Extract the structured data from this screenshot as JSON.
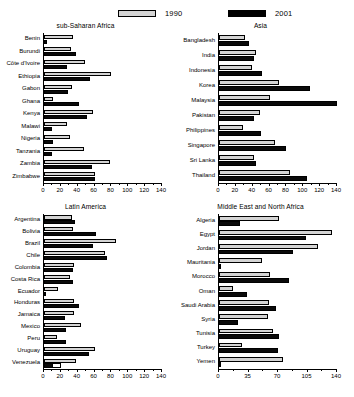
{
  "legend": {
    "items": [
      {
        "key": "y1990",
        "label": "1990",
        "color": "#d4d4d4"
      },
      {
        "key": "y2001",
        "label": "2001",
        "color": "#000000"
      }
    ]
  },
  "chart_data": [
    {
      "type": "bar",
      "title": "sub-Saharan Africa",
      "orientation": "horizontal",
      "xlabel": "",
      "ylabel": "",
      "xlim": [
        0,
        140
      ],
      "xticks": [
        0,
        20,
        40,
        60,
        80,
        100,
        120,
        140
      ],
      "tick_labels": [
        "0",
        "20",
        "40",
        "60",
        "80",
        "100",
        "120",
        "140"
      ],
      "grid": false,
      "legend_position": "top",
      "categories": [
        "Benin",
        "Burundi",
        "Côte d'Ivoire",
        "Ethiopia",
        "Gabon",
        "Ghana",
        "Kenya",
        "Malawi",
        "Nigeria",
        "Tanzania",
        "Zambia",
        "Zimbabwe"
      ],
      "series": [
        {
          "name": "1990",
          "values": [
            34,
            32,
            49,
            80,
            33,
            11,
            58,
            27,
            31,
            48,
            78,
            60
          ]
        },
        {
          "name": "2001",
          "values": [
            4,
            38,
            27,
            55,
            29,
            42,
            51,
            9,
            11,
            10,
            57,
            60
          ]
        }
      ]
    },
    {
      "type": "bar",
      "title": "Asia",
      "orientation": "horizontal",
      "xlabel": "",
      "ylabel": "",
      "xlim": [
        0,
        140
      ],
      "xticks": [
        0,
        20,
        40,
        60,
        80,
        100,
        120,
        140
      ],
      "tick_labels": [
        "0",
        "20",
        "40",
        "60",
        "80",
        "100",
        "120",
        "140"
      ],
      "grid": false,
      "legend_position": "top",
      "categories": [
        "Bangladesh",
        "India",
        "Indonesia",
        "Korea",
        "Malaysia",
        "Pakistan",
        "Philippines",
        "Singapore",
        "Sri Lanka",
        "Thailand"
      ],
      "series": [
        {
          "name": "1990",
          "values": [
            31,
            44,
            39,
            71,
            60,
            49,
            29,
            67,
            42,
            84
          ]
        },
        {
          "name": "2001",
          "values": [
            36,
            42,
            51,
            108,
            140,
            41,
            50,
            79,
            44,
            104
          ]
        }
      ]
    },
    {
      "type": "bar",
      "title": "Latin America",
      "orientation": "horizontal",
      "xlabel": "",
      "ylabel": "",
      "xlim": [
        0,
        140
      ],
      "xticks": [
        0,
        20,
        40,
        60,
        80,
        100,
        120,
        140
      ],
      "tick_labels": [
        "0",
        "20",
        "40",
        "60",
        "80",
        "100",
        "120",
        "140"
      ],
      "grid": false,
      "legend_position": "top",
      "categories": [
        "Argentina",
        "Bolivia",
        "Brazil",
        "Chile",
        "Colombia",
        "Costa Rica",
        "Ecuador",
        "Honduras",
        "Jamaica",
        "Mexico",
        "Peru",
        "Uruguay",
        "Venezuela"
      ],
      "series": [
        {
          "name": "1990",
          "values": [
            33,
            34,
            86,
            72,
            36,
            31,
            17,
            35,
            35,
            44,
            16,
            60,
            38
          ]
        },
        {
          "name": "2001",
          "values": [
            37,
            62,
            58,
            75,
            34,
            34,
            2,
            41,
            25,
            26,
            26,
            53,
            20
          ]
        }
      ]
    },
    {
      "type": "bar",
      "title": "Middle East and North Africa",
      "orientation": "horizontal",
      "xlabel": "",
      "ylabel": "",
      "xlim": [
        0,
        140
      ],
      "xticks": [
        0,
        35,
        70,
        105,
        140
      ],
      "tick_labels": [
        "0",
        "35",
        "70",
        "105",
        "140"
      ],
      "grid": false,
      "legend_position": "top",
      "categories": [
        "Algeria",
        "Egypt",
        "Jordan",
        "Mauritania",
        "Morocco",
        "Oman",
        "Saudi Arabia",
        "Syria",
        "Tunisia",
        "Turkey",
        "Yemen"
      ],
      "series": [
        {
          "name": "1990",
          "values": [
            71,
            134,
            117,
            51,
            60,
            17,
            59,
            58,
            64,
            27,
            76
          ]
        },
        {
          "name": "2001",
          "values": [
            25,
            103,
            88,
            0,
            83,
            33,
            68,
            23,
            71,
            70,
            2
          ]
        }
      ]
    }
  ]
}
